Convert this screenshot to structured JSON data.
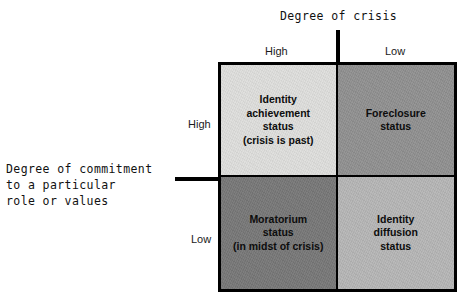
{
  "axes": {
    "top": {
      "title": "Degree of crisis",
      "ticks": {
        "left": "High",
        "right": "Low"
      }
    },
    "left": {
      "title": "Degree of commitment\nto a particular\nrole or values",
      "ticks": {
        "top": "High",
        "bottom": "Low"
      }
    }
  },
  "matrix": {
    "quadrants": [
      {
        "id": "identity-achievement",
        "label": "Identity\nachievement\nstatus\n(crisis is past)",
        "crisis": "High",
        "commitment": "High",
        "fill": "#dededc"
      },
      {
        "id": "foreclosure",
        "label": "Foreclosure\nstatus",
        "crisis": "Low",
        "commitment": "High",
        "fill": "#8f8f8f"
      },
      {
        "id": "moratorium",
        "label": "Moratorium\nstatus\n(in midst of crisis)",
        "crisis": "High",
        "commitment": "Low",
        "fill": "#767676"
      },
      {
        "id": "identity-diffusion",
        "label": "Identity\ndiffusion\nstatus",
        "crisis": "Low",
        "commitment": "Low",
        "fill": "#b5b5b5"
      }
    ]
  },
  "style": {
    "background": "#ffffff",
    "line_color": "#000000",
    "text_color": "#111111"
  }
}
